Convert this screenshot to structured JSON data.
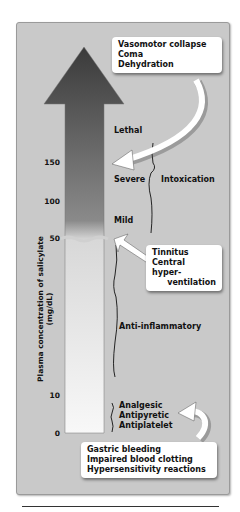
{
  "figure": {
    "y_axis_label": "Plasma concentration of salicylate (mg/dL)",
    "ticks": [
      {
        "value": "150",
        "y": 163
      },
      {
        "value": "100",
        "y": 202
      },
      {
        "value": "50",
        "y": 239
      },
      {
        "value": "10",
        "y": 396
      },
      {
        "value": "0",
        "y": 434
      }
    ],
    "levels": {
      "lethal": "Lethal",
      "severe": "Severe",
      "mild": "Mild",
      "intoxication": "Intoxication",
      "anti_inflammatory": "Anti-inflammatory",
      "analgesic": "Analgesic",
      "antipyretic": "Antipyretic",
      "antiplatelet": "Antiplatelet"
    },
    "callouts": {
      "top": [
        "Vasomotor collapse",
        "Coma",
        "Dehydration"
      ],
      "middle": [
        "Tinnitus",
        "Central hyper-",
        "ventilation"
      ],
      "bottom": [
        "Gastric bleeding",
        "Impaired blood clotting",
        "Hypersensitivity reactions"
      ]
    },
    "colors": {
      "panel": "#c9c9c9",
      "arrow_top": "#3c3c3c",
      "arrow_bottom": "#f7f7f7"
    }
  }
}
